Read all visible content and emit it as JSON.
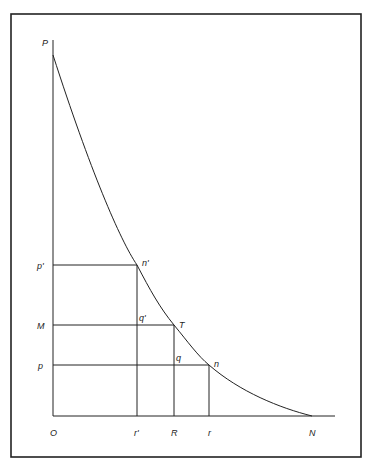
{
  "figure": {
    "frame": {
      "x1": 11,
      "y1": 14,
      "x2": 361,
      "y2": 457
    },
    "axes": {
      "origin": {
        "x": 53,
        "y": 416
      },
      "y_top": 40,
      "x_right": 335
    },
    "curve": {
      "start": {
        "x": 53,
        "y": 55
      },
      "end": {
        "x": 312,
        "y": 416
      }
    },
    "labels": {
      "P": "P",
      "p_prime": "p'",
      "M": "M",
      "p": "p",
      "n_prime": "n'",
      "q_prime": "q'",
      "T": "T",
      "q": "q",
      "n": "n",
      "O": "O",
      "r_prime": "r'",
      "R": "R",
      "r": "r",
      "N": "N"
    },
    "points": {
      "n_prime": {
        "x": 137,
        "y": 265
      },
      "T": {
        "x": 174,
        "y": 325
      },
      "n": {
        "x": 209,
        "y": 365
      }
    }
  }
}
